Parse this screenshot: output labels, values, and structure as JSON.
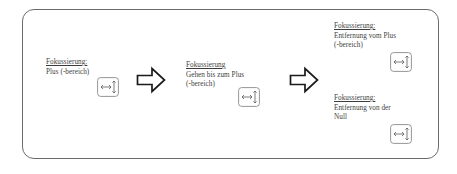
{
  "diagram": {
    "frame": {
      "border_color": "#6b6b6b",
      "background": "#ffffff"
    },
    "stages": [
      {
        "id": "stage-1",
        "title": "Fokussierung:",
        "lines": [
          "Plus (-bereich)"
        ],
        "icon": "focus-area-icon"
      },
      {
        "id": "stage-2",
        "title": "Fokussierung",
        "lines": [
          "Gehen bis zum Plus",
          "(-bereich)"
        ],
        "icon": "focus-area-icon"
      },
      {
        "id": "stage-3",
        "title": "Fokussierung:",
        "lines": [
          "Entfernung vom Plus",
          "(-bereich)"
        ],
        "icon": "focus-area-icon"
      },
      {
        "id": "stage-4",
        "title": "Fokussierung:",
        "lines": [
          "Entfernung von der",
          "Null"
        ],
        "icon": "focus-area-icon"
      }
    ],
    "arrows": [
      {
        "id": "arrow-1",
        "direction": "right",
        "icon": "block-arrow-right-icon"
      },
      {
        "id": "arrow-2",
        "direction": "right",
        "icon": "block-arrow-right-icon"
      }
    ]
  }
}
